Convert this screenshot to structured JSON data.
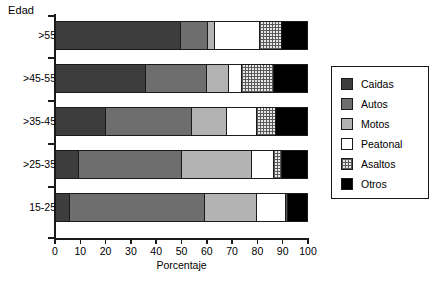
{
  "chart_data": {
    "type": "bar",
    "orientation": "horizontal",
    "stacked": true,
    "title": "",
    "xlabel": "Porcentaje",
    "ylabel": "Edad",
    "xlim": [
      0,
      100
    ],
    "xticks": [
      0,
      10,
      20,
      30,
      40,
      50,
      60,
      70,
      80,
      90,
      100
    ],
    "xtick_labels": [
      "0",
      "10",
      "20",
      "30",
      "40",
      "50",
      "60",
      "70",
      "80",
      "90",
      "100"
    ],
    "grid": false,
    "legend_position": "right",
    "categories": [
      ">55",
      ">45-55",
      ">35-45",
      ">25-35",
      "15-25"
    ],
    "series": [
      {
        "name": "Caidas",
        "color": "#3d3d3d",
        "values": [
          50.0,
          36.0,
          20.0,
          9.0,
          5.5
        ]
      },
      {
        "name": "Autos",
        "color": "#6e6e6e",
        "values": [
          11.0,
          24.0,
          34.0,
          41.0,
          54.0
        ]
      },
      {
        "name": "Motos",
        "color": "#b3b3b3",
        "values": [
          2.5,
          9.0,
          14.0,
          28.0,
          21.0
        ]
      },
      {
        "name": "Peatonal",
        "color": "#ffffff",
        "values": [
          18.0,
          5.0,
          12.0,
          9.0,
          11.5
        ]
      },
      {
        "name": "Asaltos",
        "color": "#e8e8e8",
        "values": [
          9.0,
          13.0,
          7.5,
          3.0,
          1.0
        ]
      },
      {
        "name": "Otros",
        "color": "#000000",
        "values": [
          10.0,
          13.0,
          12.5,
          10.0,
          7.5
        ]
      }
    ]
  },
  "axes": {
    "y_title": "Edad",
    "x_title": "Porcentaje"
  },
  "legend": {
    "items": [
      {
        "label": "Caidas",
        "fill": "caidas"
      },
      {
        "label": "Autos",
        "fill": "autos"
      },
      {
        "label": "Motos",
        "fill": "motos"
      },
      {
        "label": "Peatonal",
        "fill": "peatonal"
      },
      {
        "label": "Asaltos",
        "fill": "asaltos"
      },
      {
        "label": "Otros",
        "fill": "otros"
      }
    ]
  }
}
